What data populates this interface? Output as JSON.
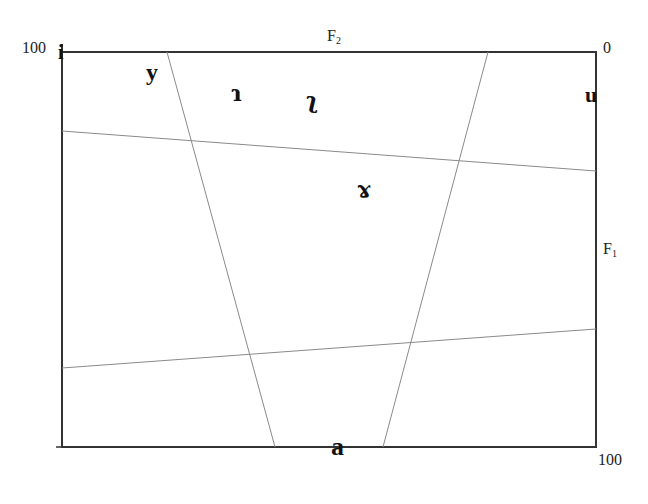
{
  "axes": {
    "top": {
      "name": "F",
      "subscript": "2",
      "left_value": "100",
      "right_value": "0"
    },
    "right": {
      "name": "F",
      "subscript": "1",
      "top_value": "0",
      "bottom_value": "100"
    }
  },
  "vowels": [
    {
      "id": "i",
      "symbol": "i"
    },
    {
      "id": "y",
      "symbol": "y"
    },
    {
      "id": "rho-left",
      "symbol": "ɿ"
    },
    {
      "id": "rho-right",
      "symbol": "ʅ"
    },
    {
      "id": "u",
      "symbol": "u"
    },
    {
      "id": "ram",
      "symbol": "ɤ"
    },
    {
      "id": "a",
      "symbol": "a"
    }
  ],
  "colors": {
    "frame": "#333333",
    "grid": "#8a8a8a",
    "text": "#111111"
  }
}
